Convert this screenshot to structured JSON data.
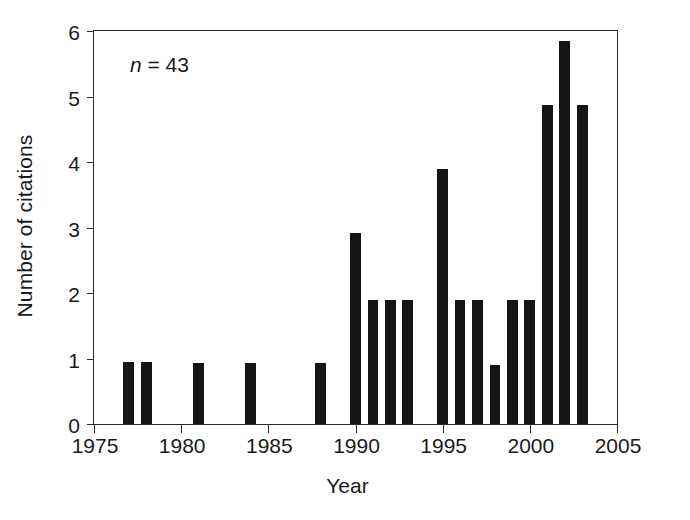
{
  "chart_data": {
    "type": "bar",
    "title": "",
    "subtitle": "",
    "xlabel": "Year",
    "ylabel": "Number of citations",
    "xlim": [
      1975,
      2005
    ],
    "ylim": [
      0,
      6
    ],
    "grid": false,
    "legend": null,
    "xticks": [
      1975,
      1980,
      1985,
      1990,
      1995,
      2000,
      2005
    ],
    "xtick_labels": [
      "1975",
      "1980",
      "1985",
      "1990",
      "1995",
      "2000",
      "2005"
    ],
    "yticks": [
      0,
      1,
      2,
      3,
      4,
      5,
      6
    ],
    "ytick_labels": [
      "0",
      "1",
      "2",
      "3",
      "4",
      "5",
      "6"
    ],
    "bar_color": "#151515",
    "annotations": [
      {
        "name": "sample-size",
        "symbol": "n",
        "text": " = 43",
        "full_text": "n = 43"
      }
    ],
    "categories": [
      1977,
      1978,
      1981,
      1984,
      1988,
      1990,
      1991,
      1992,
      1993,
      1995,
      1996,
      1997,
      1999,
      1998,
      2000,
      2001,
      2002,
      2003
    ],
    "x": [
      1977,
      1978,
      1981,
      1984,
      1988,
      1990,
      1991,
      1992,
      1993,
      1995,
      1996,
      1997,
      1998,
      1999,
      2000,
      2001,
      2002,
      2003
    ],
    "values": [
      0.95,
      0.95,
      0.93,
      0.93,
      0.93,
      2.92,
      1.9,
      1.9,
      1.9,
      3.9,
      1.9,
      1.9,
      0.9,
      1.9,
      1.9,
      4.87,
      5.85,
      4.87
    ],
    "bars": [
      {
        "year": 1977,
        "value": 0.95
      },
      {
        "year": 1978,
        "value": 0.95
      },
      {
        "year": 1981,
        "value": 0.93
      },
      {
        "year": 1984,
        "value": 0.93
      },
      {
        "year": 1988,
        "value": 0.93
      },
      {
        "year": 1990,
        "value": 2.92
      },
      {
        "year": 1991,
        "value": 1.9
      },
      {
        "year": 1992,
        "value": 1.9
      },
      {
        "year": 1993,
        "value": 1.9
      },
      {
        "year": 1995,
        "value": 3.9
      },
      {
        "year": 1996,
        "value": 1.9
      },
      {
        "year": 1997,
        "value": 1.9
      },
      {
        "year": 1998,
        "value": 0.9
      },
      {
        "year": 1999,
        "value": 1.9
      },
      {
        "year": 2000,
        "value": 1.9
      },
      {
        "year": 2001,
        "value": 4.87
      },
      {
        "year": 2002,
        "value": 5.85
      },
      {
        "year": 2003,
        "value": 4.87
      }
    ]
  }
}
